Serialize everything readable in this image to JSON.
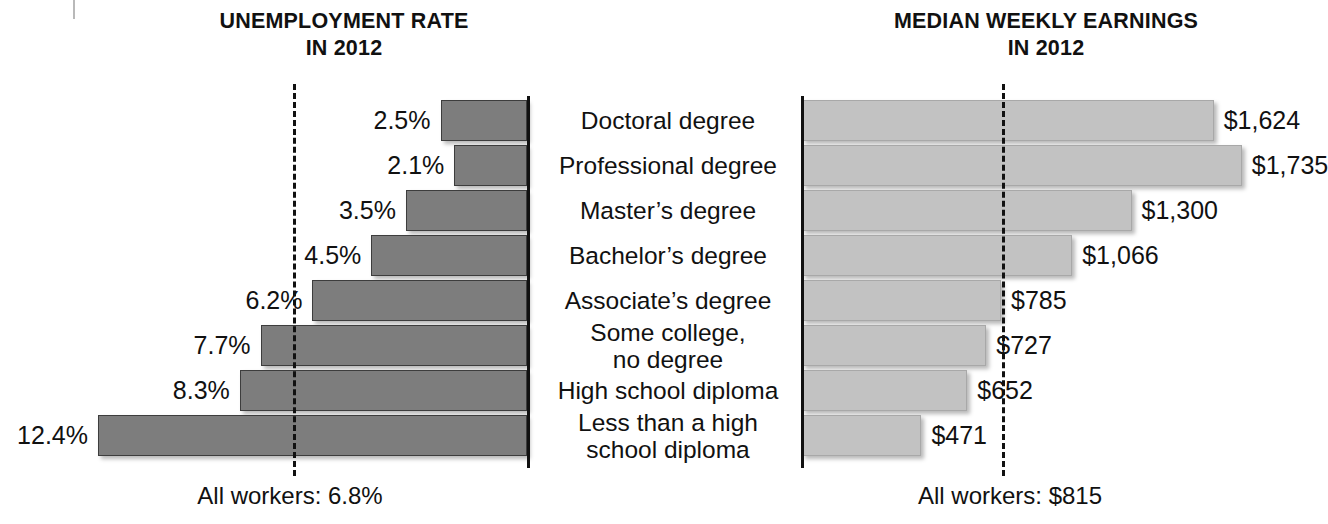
{
  "chart_data": [
    {
      "type": "bar",
      "orientation": "horizontal",
      "title": "UNEMPLOYMENT RATE IN 2012",
      "title_line1": "UNEMPLOYMENT RATE",
      "title_line2": "IN 2012",
      "xlabel": "",
      "ylabel": "",
      "direction": "right-to-left",
      "xlim": [
        0,
        14
      ],
      "grid": false,
      "legend": "none",
      "bar_color": "#7d7d7d",
      "categories": [
        "Doctoral degree",
        "Professional degree",
        "Master's degree",
        "Bachelor's degree",
        "Associate's degree",
        "Some college, no degree",
        "High school diploma",
        "Less than a high school diploma"
      ],
      "values": [
        2.5,
        2.1,
        3.5,
        4.5,
        6.2,
        7.7,
        8.3,
        12.4
      ],
      "value_labels": [
        "2.5%",
        "2.1%",
        "3.5%",
        "4.5%",
        "6.2%",
        "7.7%",
        "8.3%",
        "12.4%"
      ],
      "reference_line": {
        "label": "All workers: 6.8%",
        "value": 6.8,
        "style": "dashed"
      }
    },
    {
      "type": "bar",
      "orientation": "horizontal",
      "title": "MEDIAN WEEKLY EARNINGS IN 2012",
      "title_line1": "MEDIAN WEEKLY EARNINGS",
      "title_line2": "IN 2012",
      "xlabel": "",
      "ylabel": "",
      "direction": "left-to-right",
      "xlim": [
        0,
        1800
      ],
      "grid": false,
      "legend": "none",
      "bar_color": "#c2c2c2",
      "categories": [
        "Doctoral degree",
        "Professional degree",
        "Master's degree",
        "Bachelor's degree",
        "Associate's degree",
        "Some college, no degree",
        "High school diploma",
        "Less than a high school diploma"
      ],
      "values": [
        1624,
        1735,
        1300,
        1066,
        785,
        727,
        652,
        471
      ],
      "value_labels": [
        "$1,624",
        "$1,735",
        "$1,300",
        "$1,066",
        "$785",
        "$727",
        "$652",
        "$471"
      ],
      "reference_line": {
        "label": "All workers: $815",
        "value": 815,
        "style": "dashed"
      }
    }
  ],
  "left": {
    "title_line1": "UNEMPLOYMENT RATE",
    "title_line2": "IN 2012",
    "footer": "All workers: 6.8%",
    "labels": [
      "2.5%",
      "2.1%",
      "3.5%",
      "4.5%",
      "6.2%",
      "7.7%",
      "8.3%",
      "12.4%"
    ]
  },
  "right": {
    "title_line1": "MEDIAN WEEKLY EARNINGS",
    "title_line2": "IN 2012",
    "footer": "All workers: $815",
    "labels": [
      "$1,624",
      "$1,735",
      "$1,300",
      "$1,066",
      "$785",
      "$727",
      "$652",
      "$471"
    ]
  },
  "categories": [
    {
      "line1": "Doctoral degree",
      "line2": ""
    },
    {
      "line1": "Professional degree",
      "line2": ""
    },
    {
      "line1": "Master’s degree",
      "line2": ""
    },
    {
      "line1": "Bachelor’s degree",
      "line2": ""
    },
    {
      "line1": "Associate’s degree",
      "line2": ""
    },
    {
      "line1": "Some college,",
      "line2": "no degree"
    },
    {
      "line1": "High school diploma",
      "line2": ""
    },
    {
      "line1": "Less than a high",
      "line2": "school diploma"
    }
  ],
  "colors": {
    "bar_left": "#7d7d7d",
    "bar_right": "#c2c2c2",
    "axis": "#111111",
    "text": "#111111"
  }
}
